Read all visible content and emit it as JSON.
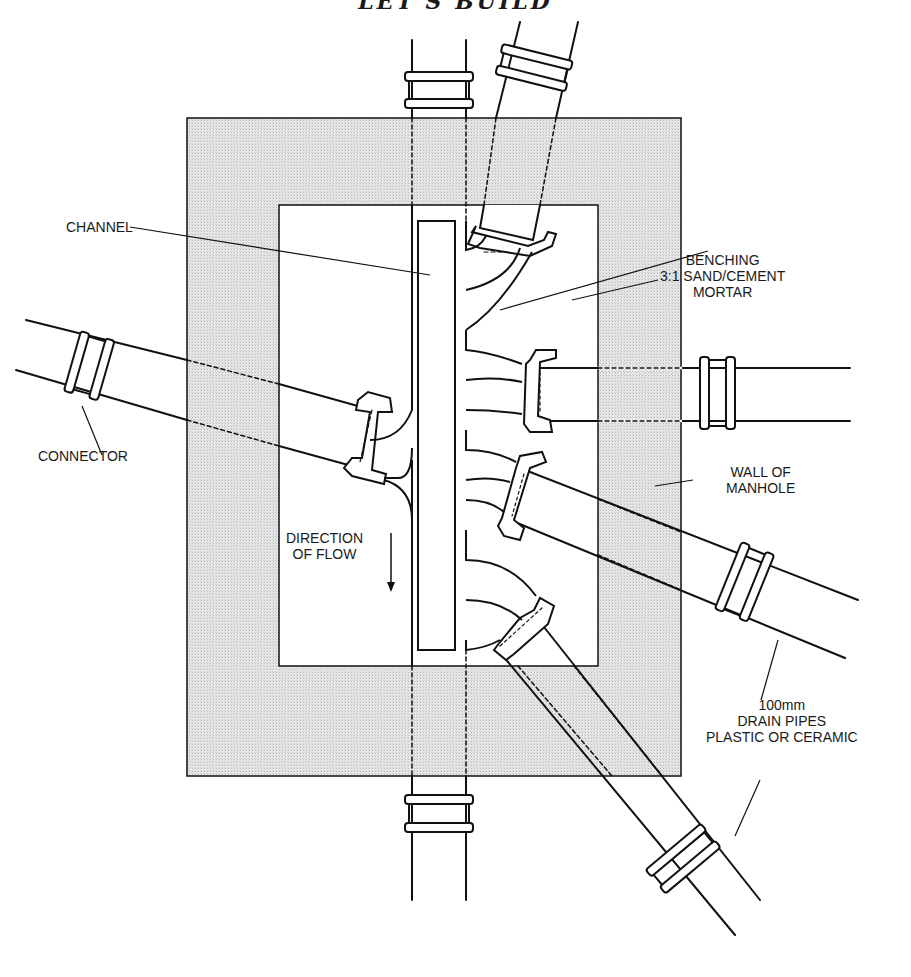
{
  "title": "LET'S BUILD",
  "colors": {
    "wall_fill": "#dedede",
    "ink": "#111111",
    "paper": "#ffffff"
  },
  "labels": {
    "channel": "CHANNEL",
    "benching": [
      "BENCHING",
      "3:1 SAND/CEMENT",
      "MORTAR"
    ],
    "connector": "CONNECTOR",
    "wall": [
      "WALL OF",
      "MANHOLE"
    ],
    "direction": [
      "DIRECTION",
      "OF FLOW"
    ],
    "pipes": [
      "100mm",
      "DRAIN PIPES",
      "PLASTIC OR CERAMIC"
    ]
  },
  "icons": {
    "flow_arrow": "arrow-down-icon"
  }
}
